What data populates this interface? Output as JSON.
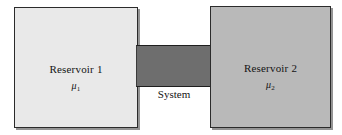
{
  "figure": {
    "caption": "",
    "background_color": "#ffffff"
  },
  "reservoirs": [
    {
      "id": "reservoir-1",
      "label": "Reservoir 1",
      "potential_symbol": "μ",
      "potential_subscript": "1",
      "fill_color": "#e9e9e9",
      "border_color": "#2b2b2b"
    },
    {
      "id": "reservoir-2",
      "label": "Reservoir 2",
      "potential_symbol": "μ",
      "potential_subscript": "2",
      "fill_color": "#b9b9b9",
      "border_color": "#2b2b2b"
    }
  ],
  "system": {
    "label": "System",
    "fill_color": "#6e6e6e",
    "border_color": "#1f1f1f"
  }
}
